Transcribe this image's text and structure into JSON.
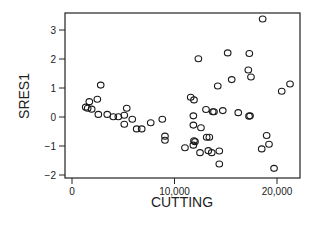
{
  "chart_data": {
    "type": "scatter",
    "title": "",
    "xlabel": "CUTTING",
    "ylabel": "SRES1",
    "xlim": [
      -700,
      22500
    ],
    "ylim": [
      -2.1,
      3.6
    ],
    "grid": false,
    "legend": null,
    "xticks": [
      0,
      10000,
      20000
    ],
    "xtick_labels": [
      "0",
      "10,000",
      "20,000"
    ],
    "yticks": [
      -2,
      -1,
      0,
      1,
      2,
      3
    ],
    "ytick_labels": [
      "−2",
      "−1",
      "0",
      "1",
      "2",
      "3"
    ],
    "marker": "open-circle",
    "points": [
      {
        "x": 2800,
        "y": 1.1
      },
      {
        "x": 2470,
        "y": 0.61
      },
      {
        "x": 1690,
        "y": 0.53
      },
      {
        "x": 1340,
        "y": 0.34
      },
      {
        "x": 1530,
        "y": 0.3
      },
      {
        "x": 1920,
        "y": 0.27
      },
      {
        "x": 2570,
        "y": 0.09
      },
      {
        "x": 3440,
        "y": 0.09
      },
      {
        "x": 4030,
        "y": 0.01
      },
      {
        "x": 4520,
        "y": 0.01
      },
      {
        "x": 5100,
        "y": 0.06
      },
      {
        "x": 5340,
        "y": 0.3
      },
      {
        "x": 5100,
        "y": -0.25
      },
      {
        "x": 5880,
        "y": -0.08
      },
      {
        "x": 6310,
        "y": -0.41
      },
      {
        "x": 6800,
        "y": -0.41
      },
      {
        "x": 7680,
        "y": -0.2
      },
      {
        "x": 8810,
        "y": -0.08
      },
      {
        "x": 9070,
        "y": -0.66
      },
      {
        "x": 9070,
        "y": -0.8
      },
      {
        "x": 11580,
        "y": 0.68
      },
      {
        "x": 11900,
        "y": 0.59
      },
      {
        "x": 13070,
        "y": 0.26
      },
      {
        "x": 13730,
        "y": 0.18
      },
      {
        "x": 13850,
        "y": 0.18
      },
      {
        "x": 14710,
        "y": 0.22
      },
      {
        "x": 16220,
        "y": 0.15
      },
      {
        "x": 17270,
        "y": 0.03
      },
      {
        "x": 11840,
        "y": 0.04
      },
      {
        "x": 11840,
        "y": -0.28
      },
      {
        "x": 12580,
        "y": -0.37
      },
      {
        "x": 11900,
        "y": -0.82
      },
      {
        "x": 12000,
        "y": -0.85
      },
      {
        "x": 11840,
        "y": -0.97
      },
      {
        "x": 13140,
        "y": -0.7
      },
      {
        "x": 13400,
        "y": -0.7
      },
      {
        "x": 11020,
        "y": -1.06
      },
      {
        "x": 12490,
        "y": -1.23
      },
      {
        "x": 13300,
        "y": -1.16
      },
      {
        "x": 13630,
        "y": -1.23
      },
      {
        "x": 14370,
        "y": -1.17
      },
      {
        "x": 14370,
        "y": -1.62
      },
      {
        "x": 18600,
        "y": 3.38
      },
      {
        "x": 12330,
        "y": 2.01
      },
      {
        "x": 15190,
        "y": 2.21
      },
      {
        "x": 17300,
        "y": 2.19
      },
      {
        "x": 17200,
        "y": 1.62
      },
      {
        "x": 17460,
        "y": 1.38
      },
      {
        "x": 15580,
        "y": 1.29
      },
      {
        "x": 14220,
        "y": 1.07
      },
      {
        "x": 20460,
        "y": 0.89
      },
      {
        "x": 21270,
        "y": 1.14
      },
      {
        "x": 17370,
        "y": 0.04
      },
      {
        "x": 18990,
        "y": -0.64
      },
      {
        "x": 19220,
        "y": -0.94
      },
      {
        "x": 18510,
        "y": -1.1
      },
      {
        "x": 19710,
        "y": -1.77
      }
    ]
  },
  "plot": {
    "xlabel": "CUTTING",
    "ylabel": "SRES1",
    "xtick_labels": [
      "0",
      "10,000",
      "20,000"
    ],
    "ytick_labels": [
      "−2",
      "−1",
      "0",
      "1",
      "2",
      "3"
    ],
    "colors": {
      "axis": "#222222",
      "marker": "#1a1a1a",
      "background": "#ffffff"
    }
  }
}
